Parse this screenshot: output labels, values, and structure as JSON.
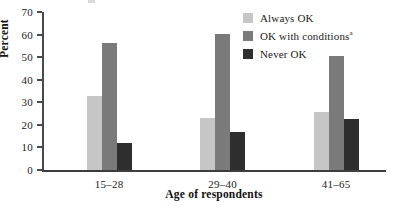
{
  "chart_data": {
    "type": "bar",
    "title": "",
    "xlabel": "Age of respondents",
    "ylabel": "Percent",
    "categories": [
      "15–28",
      "29–40",
      "41–65"
    ],
    "series": [
      {
        "name": "Always OK",
        "color": "#c6c6c6",
        "values": [
          32.7,
          23.0,
          25.5
        ]
      },
      {
        "name": "OK with conditions",
        "name_superscript": "a",
        "color": "#7a7a7a",
        "values": [
          56.2,
          60.2,
          50.6
        ]
      },
      {
        "name": "Never OK",
        "color": "#2e2e2e",
        "values": [
          12.0,
          16.8,
          22.7
        ]
      }
    ],
    "ylim": [
      0,
      70
    ],
    "yticks": [
      0,
      10,
      20,
      30,
      40,
      50,
      60,
      70
    ],
    "ytick_labels": [
      "0",
      "10",
      "20",
      "30",
      "40",
      "50",
      "60",
      "70"
    ],
    "grid": false,
    "legend_position": "top-right"
  },
  "axes": {
    "y_title": "Percent",
    "x_title": "Age of respondents"
  },
  "legend": {
    "items": [
      {
        "label": "Always OK",
        "sup": ""
      },
      {
        "label": "OK with conditions",
        "sup": "a"
      },
      {
        "label": "Never OK",
        "sup": ""
      }
    ]
  },
  "colors": {
    "series_light": "#c6c6c6",
    "series_medium": "#7a7a7a",
    "series_dark": "#2e2e2e",
    "axis": "#3d3d3d",
    "text": "#1b1b1b"
  }
}
